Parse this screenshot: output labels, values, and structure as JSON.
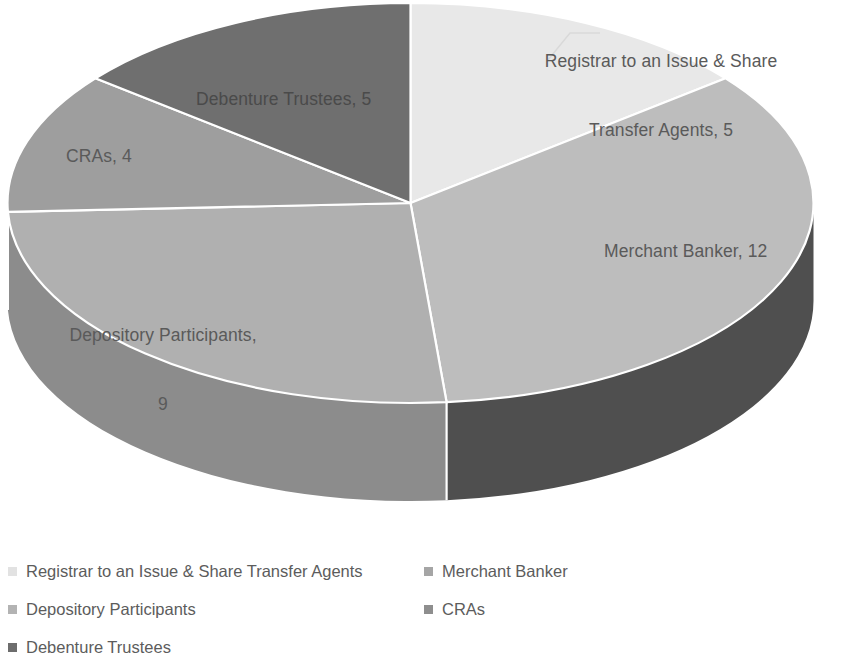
{
  "chart_data": {
    "type": "pie",
    "title": "",
    "subtitle": "",
    "xlabel": "",
    "ylabel": "",
    "total": 35,
    "style": "3d-exploded-grayscale",
    "legend_position": "bottom",
    "grid": false,
    "categories": [
      "Registrar to an Issue & Share Transfer Agents",
      "Merchant Banker",
      "Depository Participants",
      "CRAs",
      "Debenture Trustees"
    ],
    "values": [
      5,
      12,
      9,
      4,
      5
    ],
    "slices": [
      {
        "label": "Registrar to an Issue & Share Transfer Agents",
        "value": 5,
        "data_label": "Registrar to an Issue & Share\nTransfer Agents, 5",
        "percent": 14.3,
        "start_angle": 0,
        "end_angle": 51.43,
        "top_color": "#e8e8e8",
        "side_color": "#c2c2c2",
        "swatch_color": "#e8e8e8",
        "label_outside": true
      },
      {
        "label": "Merchant Banker",
        "value": 12,
        "data_label": "Merchant Banker, 12",
        "percent": 34.3,
        "start_angle": 51.43,
        "end_angle": 174.86,
        "top_color": "#bdbdbd",
        "side_color": "#4f4f4f",
        "swatch_color": "#9a9a9a",
        "label_outside": false
      },
      {
        "label": "Depository Participants",
        "value": 9,
        "data_label": "Depository Participants,\n9",
        "percent": 25.7,
        "start_angle": 174.86,
        "end_angle": 267.43,
        "top_color": "#b0b0b0",
        "side_color": "#8c8c8c",
        "swatch_color": "#b0b0b0",
        "label_outside": false
      },
      {
        "label": "CRAs",
        "value": 4,
        "data_label": "CRAs, 4",
        "percent": 11.4,
        "start_angle": 267.43,
        "end_angle": 308.57,
        "top_color": "#9e9e9e",
        "side_color": "#8a8a8a",
        "swatch_color": "#8f8f8f",
        "label_outside": false
      },
      {
        "label": "Debenture Trustees",
        "value": 5,
        "data_label": "Debenture Trustees, 5",
        "percent": 14.3,
        "start_angle": 308.57,
        "end_angle": 360,
        "top_color": "#6f6f6f",
        "side_color": "#6f6f6f",
        "swatch_color": "#6b6b6b",
        "label_outside": false
      }
    ]
  },
  "labels": {
    "registrar_line1": "Registrar to an Issue & Share",
    "registrar_line2": "Transfer Agents, 5",
    "merchant": "Merchant Banker, 12",
    "depository_line1": "Depository Participants,",
    "depository_line2": "9",
    "cras": "CRAs, 4",
    "debenture": "Debenture Trustees, 5"
  },
  "legend": {
    "items": [
      {
        "label": "Registrar to an Issue & Share Transfer Agents",
        "color": "#e2e2e2"
      },
      {
        "label": "Merchant Banker",
        "color": "#a5a5a5"
      },
      {
        "label": "Depository Participants",
        "color": "#b3b3b3"
      },
      {
        "label": "CRAs",
        "color": "#8e8e8e"
      },
      {
        "label": "Debenture Trustees",
        "color": "#6d6d6d"
      }
    ]
  },
  "colors": {
    "background": "#ffffff",
    "text": "#595959",
    "divider": "#ffffff"
  }
}
